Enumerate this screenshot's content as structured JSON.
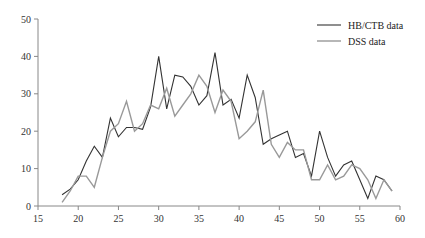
{
  "chart_data": {
    "type": "line",
    "title": "",
    "xlabel": "",
    "ylabel": "",
    "xlim": [
      15,
      60
    ],
    "ylim": [
      0,
      50
    ],
    "grid": false,
    "legend_position": "upper right",
    "x_ticks": [
      15,
      20,
      25,
      30,
      35,
      40,
      45,
      50,
      55,
      60
    ],
    "y_ticks": [
      0,
      10,
      20,
      30,
      40,
      50
    ],
    "x": [
      18,
      19,
      20,
      21,
      22,
      23,
      24,
      25,
      26,
      27,
      28,
      29,
      30,
      31,
      32,
      33,
      34,
      35,
      36,
      37,
      38,
      39,
      40,
      41,
      42,
      43,
      44,
      45,
      46,
      47,
      48,
      49,
      50,
      51,
      52,
      53,
      54,
      55,
      56,
      57,
      58,
      59
    ],
    "series": [
      {
        "name": "HB/CTB data",
        "color": "#333333",
        "values": [
          3,
          4.5,
          7,
          12,
          16,
          13,
          23.5,
          18.5,
          21,
          21,
          20.5,
          26.5,
          40,
          26,
          35,
          34.5,
          32,
          27,
          29.5,
          41,
          27,
          28.5,
          23.5,
          35,
          29,
          16.5,
          18,
          19,
          20,
          13,
          14,
          8,
          20,
          13,
          8,
          11,
          12,
          7,
          2,
          8,
          7,
          4
        ]
      },
      {
        "name": "DSS data",
        "color": "#999999",
        "values": [
          1,
          4,
          8,
          8,
          5,
          13,
          20,
          22,
          28,
          20,
          22,
          27,
          26,
          31.5,
          24,
          27,
          30,
          35,
          32,
          25,
          31,
          28,
          18,
          20,
          22.5,
          31,
          16.5,
          13,
          17,
          15,
          15,
          7,
          7,
          11,
          7,
          8,
          11,
          10,
          7,
          2,
          7,
          4
        ]
      }
    ]
  },
  "legend": {
    "items": [
      {
        "label": "HB/CTB data",
        "color": "#333333"
      },
      {
        "label": "DSS data",
        "color": "#999999"
      }
    ]
  }
}
